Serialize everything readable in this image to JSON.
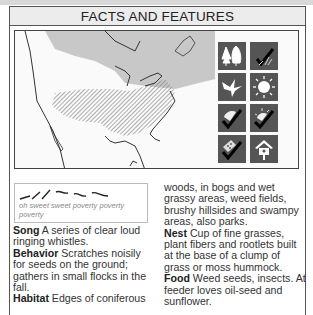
{
  "header": {
    "title": "FACTS AND FEATURES"
  },
  "map": {
    "description": "Range map of North America showing breeding range (gray) and year-round/winter range (hatched)",
    "colors": {
      "breeding": "#c8c8c8",
      "winter": "#9a9a9a",
      "land": "#ffffff",
      "border": "#333333"
    }
  },
  "habitat_icons": [
    {
      "name": "forest-icon",
      "label": "coniferous forest"
    },
    {
      "name": "checkmark-grass-icon",
      "label": "grassy areas"
    },
    {
      "name": "bird-flying-icon",
      "label": "migratory"
    },
    {
      "name": "sun-icon",
      "label": "diurnal"
    },
    {
      "name": "checkmark-nest-cup-icon",
      "label": "cup nest"
    },
    {
      "name": "checkmark-sun-nest-icon",
      "label": "nest in open"
    },
    {
      "name": "checkmark-feeder-icon",
      "label": "seed feeder"
    },
    {
      "name": "birdhouse-icon",
      "label": "birdhouse"
    }
  ],
  "song_box": {
    "phrase": "oh sweet sweet poverty poverty poverty"
  },
  "facts": {
    "song": {
      "label": "Song",
      "text": " A series of clear loud ringing whistles."
    },
    "behavior": {
      "label": "Behavior",
      "text": " Scratches noisily for seeds on the ground; gathers in small flocks in the fall."
    },
    "habitat": {
      "label": "Habitat",
      "text": " Edges of coniferous woods, in bogs and wet grassy areas, weed fields, brushy hillsides and swampy areas, also parks."
    },
    "nest": {
      "label": "Nest",
      "text": " Cup of fine grasses, plant fibers and rootlets built at the base of a clump of grass or moss hummock."
    },
    "food": {
      "label": "Food",
      "text": " Weed seeds, insects. At feeder loves oil-seed and sunflower."
    }
  },
  "columns": {
    "col1": {
      "habitat_start": " Edges of coniferous"
    },
    "col2": {
      "habitat_cont": "woods, in bogs and wet grassy areas, weed fields, brushy hillsides and swampy areas, also parks."
    }
  }
}
